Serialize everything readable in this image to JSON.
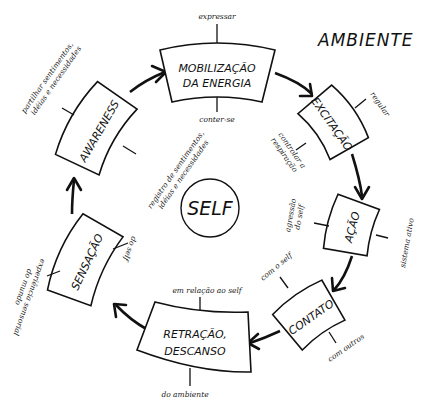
{
  "title": "AMBIENTE",
  "center": {
    "label": "SELF"
  },
  "colors": {
    "ink": "#111111",
    "background": "#ffffff"
  },
  "stages": [
    {
      "id": "mobilizacao",
      "line1": "MOBILIZAÇÃO",
      "line2": "DA ENERGIA",
      "outer_note": "expressar",
      "inner_note": "conter-se"
    },
    {
      "id": "excitacao",
      "line1": "EXCITAÇÃO",
      "line2": "",
      "outer_note": "regular",
      "inner_note_1": "controlar a",
      "inner_note_2": "respiração"
    },
    {
      "id": "acao",
      "line1": "AÇÃO",
      "line2": "",
      "outer_note": "sistema ativo",
      "inner_note_1": "agressão",
      "inner_note_2": "do self"
    },
    {
      "id": "contato",
      "line1": "CONTATO",
      "line2": "",
      "outer_note": "com outros",
      "inner_note": "com o self"
    },
    {
      "id": "retracao",
      "line1": "RETRAÇÃO,",
      "line2": "DESCANSO",
      "outer_note": "do ambiente",
      "inner_note": "em relação ao self"
    },
    {
      "id": "sensacao",
      "line1": "SENSAÇÃO",
      "line2": "",
      "outer_note_1": "experiência sensorial",
      "outer_note_2": "do mundo",
      "inner_note": "do self"
    },
    {
      "id": "awareness",
      "line1": "AWARENESS",
      "line2": "",
      "outer_note_1": "partilhar sentimentos,",
      "outer_note_2": "idéias e necessidades",
      "inner_note_1": "registro de sentimentos,",
      "inner_note_2": "idéias e necessidades"
    }
  ]
}
